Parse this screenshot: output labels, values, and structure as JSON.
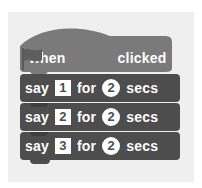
{
  "script": {
    "hat_block": {
      "prefix": "when",
      "icon": "green-flag-icon",
      "suffix": "clicked",
      "color": "#7a7a7a"
    },
    "say_blocks": [
      {
        "verb": "say",
        "message": "1",
        "joiner": "for",
        "duration": "2",
        "unit": "secs"
      },
      {
        "verb": "say",
        "message": "2",
        "joiner": "for",
        "duration": "2",
        "unit": "secs"
      },
      {
        "verb": "say",
        "message": "3",
        "joiner": "for",
        "duration": "2",
        "unit": "secs"
      }
    ],
    "say_color": "#4d4d4d",
    "background": "#efefef"
  }
}
